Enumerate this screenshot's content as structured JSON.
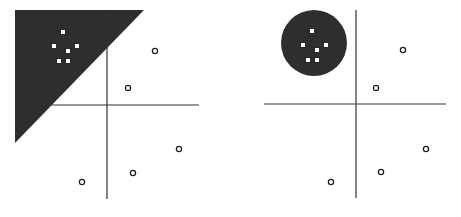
{
  "diagram": {
    "colors": {
      "region_fill": "#2e2e2e",
      "axis": "#333333",
      "marker_stroke": "#222222",
      "square_fill": "#ffffff"
    },
    "panels": [
      {
        "name": "left-panel",
        "region": {
          "shape": "triangle",
          "points": [
            [
              15,
              10
            ],
            [
              144,
              10
            ],
            [
              15,
              143
            ]
          ]
        },
        "axes": {
          "vertical": {
            "x": 107,
            "y1": 10,
            "y2": 199
          },
          "horizontal": {
            "y": 105,
            "x1": 15,
            "x2": 199
          }
        },
        "squares": [
          [
            63,
            32
          ],
          [
            54,
            46
          ],
          [
            77,
            46
          ],
          [
            68,
            51
          ],
          [
            59,
            61
          ],
          [
            68,
            61
          ]
        ],
        "circles": [
          [
            155,
            51
          ],
          [
            128,
            88
          ],
          [
            179,
            149
          ],
          [
            133,
            173
          ],
          [
            82,
            182
          ]
        ]
      },
      {
        "name": "right-panel",
        "region": {
          "shape": "circle",
          "cx": 314,
          "cy": 43,
          "r": 33
        },
        "axes": {
          "vertical": {
            "x": 356,
            "y1": 10,
            "y2": 198
          },
          "horizontal": {
            "y": 104,
            "x1": 264,
            "x2": 446
          }
        },
        "squares": [
          [
            312,
            31
          ],
          [
            303,
            45
          ],
          [
            326,
            45
          ],
          [
            317,
            50
          ],
          [
            308,
            60
          ],
          [
            317,
            60
          ]
        ],
        "circles": [
          [
            403,
            50
          ],
          [
            376,
            88
          ],
          [
            426,
            149
          ],
          [
            381,
            172
          ],
          [
            331,
            182
          ]
        ]
      }
    ]
  }
}
